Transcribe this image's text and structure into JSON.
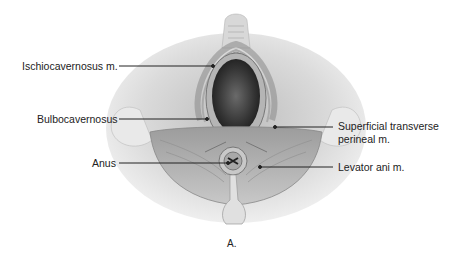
{
  "figure": {
    "caption": "A.",
    "labels": [
      {
        "id": "ischiocavernosus",
        "text": "Ischiocavernosus m."
      },
      {
        "id": "bulbocavernosus",
        "text": "Bulbocavernosus"
      },
      {
        "id": "anus",
        "text": "Anus"
      },
      {
        "id": "superficial-transverse-1",
        "text": "Superficial transverse"
      },
      {
        "id": "superficial-transverse-2",
        "text": "perineal m."
      },
      {
        "id": "levator-ani",
        "text": "Levator ani m."
      }
    ],
    "colors": {
      "skin_light": "#f2f2f2",
      "skin_mid": "#d0d0d0",
      "muscle_dark": "#8a8a8a",
      "cavity": "#3a3a3a",
      "leader_line": "#222222"
    }
  }
}
